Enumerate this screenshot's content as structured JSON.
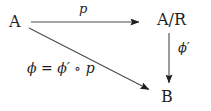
{
  "diagram": {
    "background_color": "#ffffff",
    "ink_color": "#1f1f1f",
    "nodes": [
      {
        "id": "A",
        "label": "A",
        "x": 17,
        "y": 22
      },
      {
        "id": "A/R",
        "label": "A/R",
        "x": 173,
        "y": 21
      },
      {
        "id": "B",
        "label": "B",
        "x": 167,
        "y": 97
      }
    ],
    "arrows": [
      {
        "id": "p-arrow",
        "from": "A",
        "to": "A/R",
        "kind": "horizontal",
        "label": "p",
        "label_position": "above",
        "x1": 31,
        "y1": 22,
        "x2": 140,
        "y2": 22
      },
      {
        "id": "phi-prime-arrow",
        "from": "A/R",
        "to": "B",
        "kind": "vertical",
        "label": "ϕ′",
        "label_position": "right",
        "x1": 169,
        "y1": 33,
        "x2": 169,
        "y2": 84
      },
      {
        "id": "phi-arrow",
        "from": "A",
        "to": "B",
        "kind": "diagonal",
        "label": "ϕ = ϕ′ ∘ p",
        "label_position": "below-left",
        "x1": 29,
        "y1": 28,
        "x2": 150,
        "y2": 90
      }
    ],
    "labels": {
      "p": "p",
      "phi_prime": "ϕ′",
      "composition": "ϕ = ϕ′ ∘ p"
    }
  }
}
